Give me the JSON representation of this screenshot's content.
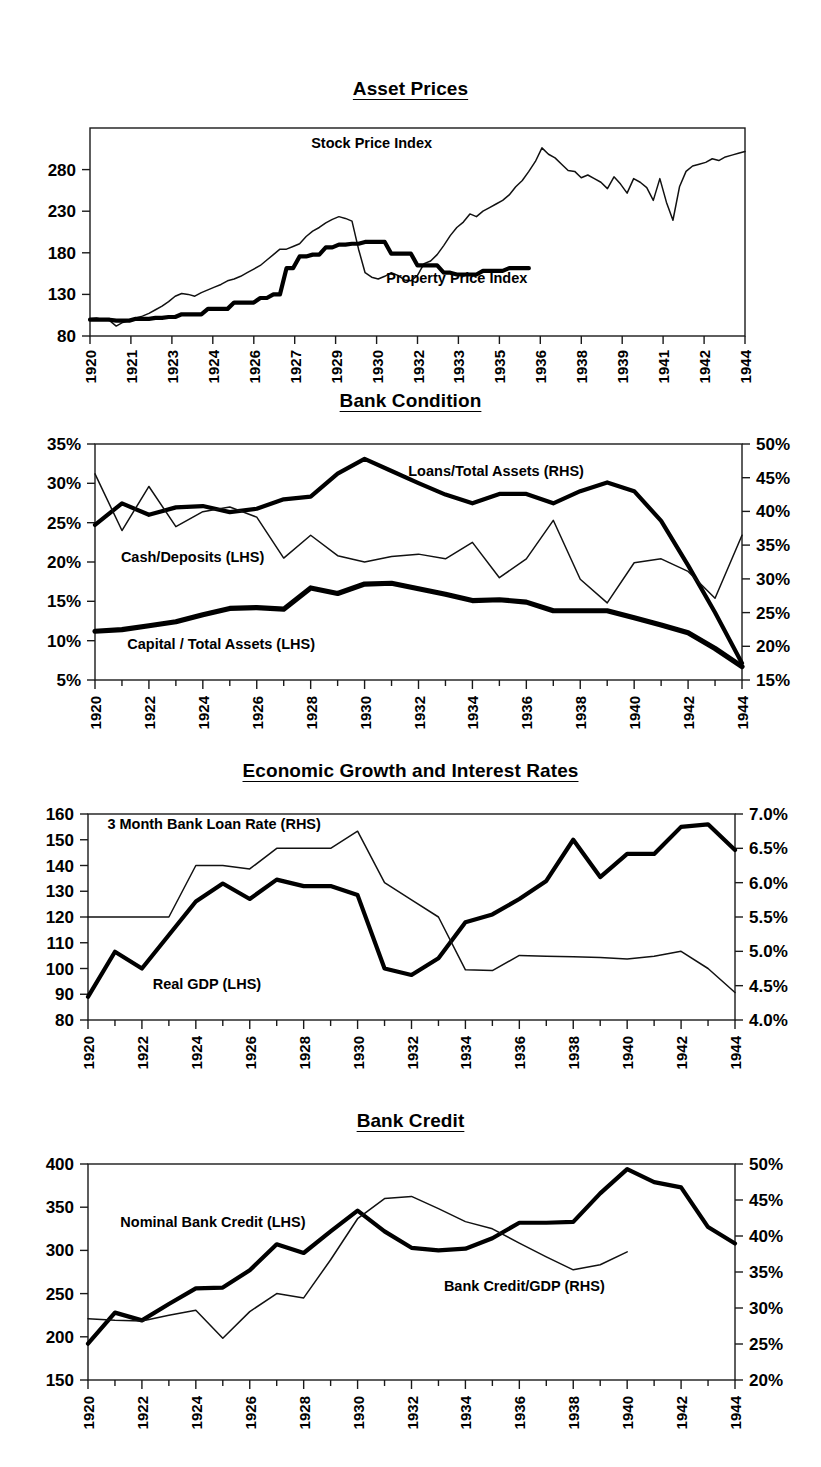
{
  "page": {
    "background": "#ffffff",
    "ink": "#000000"
  },
  "charts": [
    {
      "id": "asset-prices",
      "title": "Asset Prices",
      "chart_data": {
        "type": "line",
        "title": "Asset Prices",
        "xlabel": "",
        "ylabel": "",
        "grid": false,
        "legend": "inline-annotations",
        "y_left": {
          "ticks": [
            80,
            130,
            180,
            230,
            280
          ],
          "lim": [
            80,
            310
          ]
        },
        "x_tick_labels": [
          "1920",
          "1921",
          "1923",
          "1924",
          "1926",
          "1927",
          "1929",
          "1930",
          "1932",
          "1933",
          "1935",
          "1936",
          "1938",
          "1939",
          "1941",
          "1942",
          "1944"
        ],
        "x": [
          1920.0,
          1920.25,
          1920.5,
          1920.75,
          1921.0,
          1921.25,
          1921.5,
          1921.75,
          1922.0,
          1922.25,
          1922.5,
          1922.75,
          1923.0,
          1923.25,
          1923.5,
          1923.75,
          1924.0,
          1924.25,
          1924.5,
          1924.75,
          1925.0,
          1925.25,
          1925.5,
          1925.75,
          1926.0,
          1926.25,
          1926.5,
          1926.75,
          1927.0,
          1927.25,
          1927.5,
          1927.75,
          1928.0,
          1928.25,
          1928.5,
          1928.75,
          1929.0,
          1929.25,
          1929.5,
          1929.75,
          1930.0,
          1930.25,
          1930.5,
          1930.75,
          1931.0,
          1931.25,
          1931.5,
          1931.75,
          1932.0,
          1932.25,
          1932.5,
          1932.75,
          1933.0,
          1933.25,
          1933.5,
          1933.75,
          1934.0,
          1934.25,
          1934.5,
          1934.75,
          1935.0,
          1935.25,
          1935.5,
          1935.75,
          1936.0,
          1936.25,
          1936.5,
          1936.75,
          1937.0,
          1937.25,
          1937.5,
          1937.75,
          1938.0,
          1938.25,
          1938.5,
          1938.75,
          1939.0,
          1939.25,
          1939.5,
          1939.75,
          1940.0,
          1940.25,
          1940.5,
          1940.75,
          1941.0,
          1941.25,
          1941.5,
          1941.75,
          1942.0,
          1942.25,
          1942.5,
          1942.75,
          1943.0,
          1943.25,
          1943.5,
          1943.75,
          1944.0,
          1944.25,
          1944.5,
          1944.75,
          1945.0
        ],
        "series": [
          {
            "name": "Stock Price Index",
            "label": "Stock Price Index",
            "style": "thin",
            "values": [
              99,
              100,
              98,
              97,
              91,
              95,
              97,
              100,
              102,
              105,
              109,
              113,
              118,
              124,
              127,
              126,
              124,
              128,
              131,
              134,
              137,
              141,
              143,
              146,
              150,
              154,
              158,
              164,
              170,
              176,
              176,
              179,
              182,
              190,
              196,
              200,
              205,
              209,
              212,
              210,
              207,
              176,
              150,
              145,
              143,
              146,
              150,
              147,
              142,
              141,
              147,
              160,
              163,
              170,
              180,
              191,
              200,
              206,
              215,
              212,
              218,
              222,
              226,
              230,
              236,
              245,
              252,
              262,
              273,
              288,
              281,
              277,
              270,
              263,
              262,
              255,
              258,
              254,
              250,
              243,
              256,
              248,
              238,
              254,
              250,
              244,
              230,
              254,
              228,
              208,
              245,
              262,
              268,
              270,
              272,
              276,
              274,
              278,
              280,
              282,
              284
            ]
          },
          {
            "name": "Property Price Index",
            "label": "Property Price Index",
            "style": "thick",
            "values": [
              98,
              98,
              98,
              98,
              97,
              97,
              97,
              99,
              99,
              99,
              100,
              100,
              101,
              101,
              104,
              104,
              104,
              104,
              110,
              110,
              110,
              110,
              117,
              117,
              117,
              117,
              122,
              122,
              126,
              126,
              155,
              155,
              168,
              168,
              170,
              170,
              178,
              178,
              181,
              181,
              182,
              182,
              184,
              184,
              184,
              184,
              171,
              171,
              171,
              171,
              158,
              158,
              158,
              158,
              150,
              150,
              148,
              148,
              148,
              148,
              152,
              152,
              152,
              152,
              155,
              155,
              155,
              155,
              null,
              null,
              null,
              null,
              null,
              null,
              null,
              null,
              null,
              null,
              null,
              null,
              null,
              null,
              null,
              null,
              null,
              null,
              null,
              null,
              null,
              null,
              null,
              null,
              null,
              null,
              null,
              null,
              null,
              null,
              null,
              null,
              null
            ]
          }
        ],
        "annotations": [
          {
            "text": "Stock Price Index",
            "x_frac": 0.43,
            "y_value": 288
          },
          {
            "text": "Property Price Index",
            "x_frac": 0.56,
            "y_value": 139
          }
        ]
      }
    },
    {
      "id": "bank-condition",
      "title": "Bank Condition",
      "chart_data": {
        "type": "line",
        "title": "Bank Condition",
        "xlabel": "",
        "ylabel": "",
        "grid": false,
        "legend": "inline-annotations",
        "y_left": {
          "ticks": [
            "5%",
            "10%",
            "15%",
            "20%",
            "25%",
            "30%",
            "35%"
          ],
          "lim": [
            5,
            35
          ],
          "unit": "percent"
        },
        "y_right": {
          "ticks": [
            "15%",
            "20%",
            "25%",
            "30%",
            "35%",
            "40%",
            "45%",
            "50%"
          ],
          "lim": [
            15,
            50
          ],
          "unit": "percent"
        },
        "x_tick_labels": [
          "1920",
          "1922",
          "1924",
          "1926",
          "1928",
          "1930",
          "1932",
          "1934",
          "1936",
          "1938",
          "1940",
          "1942",
          "1944"
        ],
        "x": [
          1920,
          1921,
          1922,
          1923,
          1924,
          1925,
          1926,
          1927,
          1928,
          1929,
          1930,
          1931,
          1932,
          1933,
          1934,
          1935,
          1936,
          1937,
          1938,
          1939,
          1940,
          1941,
          1942,
          1943,
          1944
        ],
        "series": [
          {
            "name": "Loans/Total Assets (RHS)",
            "label": "Loans/Total Assets (RHS)",
            "style": "thick",
            "axis": "right",
            "values": [
              38.0,
              41.2,
              39.5,
              40.6,
              40.8,
              39.9,
              40.4,
              41.8,
              42.2,
              45.6,
              47.8,
              46.0,
              44.2,
              42.5,
              41.2,
              42.6,
              42.6,
              41.2,
              43.0,
              44.3,
              43.0,
              38.6,
              32.0,
              25.0,
              17.5
            ]
          },
          {
            "name": "Cash/Deposits (LHS)",
            "label": "Cash/Deposits (LHS)",
            "style": "thin",
            "axis": "left",
            "values": [
              31.2,
              24.0,
              29.6,
              24.5,
              26.4,
              27.0,
              25.7,
              20.5,
              23.4,
              20.8,
              20.0,
              20.7,
              21.0,
              20.4,
              22.5,
              18.0,
              20.4,
              25.3,
              17.8,
              14.8,
              19.9,
              20.4,
              18.8,
              15.4,
              23.4
            ]
          },
          {
            "name": "Capital / Total Assets (LHS)",
            "label": "Capital / Total Assets (LHS)",
            "style": "thickest",
            "axis": "left",
            "values": [
              11.2,
              11.4,
              11.9,
              12.4,
              13.3,
              14.1,
              14.2,
              14.0,
              16.7,
              16.0,
              17.2,
              17.3,
              16.6,
              15.9,
              15.1,
              15.2,
              14.9,
              13.8,
              13.8,
              13.8,
              12.9,
              12.0,
              11.0,
              9.0,
              6.7
            ]
          }
        ],
        "annotations": [
          {
            "text": "Loans/Total Assets (RHS)",
            "x_frac": 0.62,
            "y_value": 31.0
          },
          {
            "text": "Cash/Deposits (LHS)",
            "x_frac": 0.04,
            "y_value": 20.0
          },
          {
            "text": "Capital / Total Assets (LHS)",
            "x_frac": 0.05,
            "y_value": 9.0
          }
        ]
      }
    },
    {
      "id": "economic-growth-and-interest-rates",
      "title": "Economic Growth and Interest Rates",
      "chart_data": {
        "type": "line",
        "title": "Economic Growth and Interest Rates",
        "xlabel": "",
        "ylabel": "",
        "grid": false,
        "legend": "inline-annotations",
        "y_left": {
          "ticks": [
            80,
            90,
            100,
            110,
            120,
            130,
            140,
            150,
            160
          ],
          "lim": [
            80,
            160
          ]
        },
        "y_right": {
          "ticks": [
            "4.0%",
            "4.5%",
            "5.0%",
            "5.5%",
            "6.0%",
            "6.5%",
            "7.0%"
          ],
          "lim": [
            4.0,
            7.0
          ],
          "unit": "percent"
        },
        "x_tick_labels": [
          "1920",
          "1922",
          "1924",
          "1926",
          "1928",
          "1930",
          "1932",
          "1934",
          "1936",
          "1938",
          "1940",
          "1942",
          "1944"
        ],
        "x": [
          1920,
          1921,
          1922,
          1923,
          1924,
          1925,
          1926,
          1927,
          1928,
          1929,
          1930,
          1931,
          1932,
          1933,
          1934,
          1935,
          1936,
          1937,
          1938,
          1939,
          1940,
          1941,
          1942,
          1943,
          1944
        ],
        "series": [
          {
            "name": "Real GDP (LHS)",
            "label": "Real GDP (LHS)",
            "style": "thick",
            "axis": "left",
            "values": [
              89,
              106.5,
              100,
              113,
              126,
              133,
              127,
              134.5,
              132,
              132,
              128.5,
              100,
              97.5,
              104,
              118,
              121,
              127,
              134,
              150,
              135.5,
              144.5,
              144.5,
              155,
              156,
              146
            ]
          },
          {
            "name": "3 Month Bank Loan Rate (RHS)",
            "label": "3 Month Bank Loan Rate (RHS)",
            "style": "thin",
            "axis": "right",
            "values": [
              5.5,
              5.5,
              5.5,
              5.5,
              6.25,
              6.25,
              6.2,
              6.5,
              6.5,
              6.5,
              6.75,
              6.0,
              5.75,
              5.5,
              4.73,
              4.72,
              4.94,
              4.93,
              4.92,
              4.91,
              4.89,
              4.93,
              5.0,
              4.75,
              4.4
            ]
          }
        ],
        "annotations": [
          {
            "text": "3 Month Bank Loan Rate (RHS)",
            "x_frac": 0.03,
            "y_value": 154
          },
          {
            "text": "Real GDP (LHS)",
            "x_frac": 0.1,
            "y_value": 92
          }
        ]
      }
    },
    {
      "id": "bank-credit",
      "title": "Bank Credit",
      "chart_data": {
        "type": "line",
        "title": "Bank Credit",
        "xlabel": "",
        "ylabel": "",
        "grid": false,
        "legend": "inline-annotations",
        "y_left": {
          "ticks": [
            150,
            200,
            250,
            300,
            350,
            400
          ],
          "lim": [
            150,
            400
          ]
        },
        "y_right": {
          "ticks": [
            "20%",
            "25%",
            "30%",
            "35%",
            "40%",
            "45%",
            "50%"
          ],
          "lim": [
            20,
            50
          ],
          "unit": "percent"
        },
        "x_tick_labels": [
          "1920",
          "1922",
          "1924",
          "1926",
          "1928",
          "1930",
          "1932",
          "1934",
          "1936",
          "1938",
          "1940",
          "1942",
          "1944"
        ],
        "x": [
          1920,
          1921,
          1922,
          1923,
          1924,
          1925,
          1926,
          1927,
          1928,
          1929,
          1930,
          1931,
          1932,
          1933,
          1934,
          1935,
          1936,
          1937,
          1938,
          1939,
          1940,
          1941,
          1942,
          1943,
          1944
        ],
        "series": [
          {
            "name": "Nominal Bank Credit (LHS)",
            "label": "Nominal Bank Credit (LHS)",
            "style": "thick",
            "axis": "left",
            "values": [
              192,
              228,
              219,
              238,
              256,
              257,
              277,
              307,
              297,
              322,
              346,
              322,
              303,
              300,
              302,
              314,
              332,
              332,
              333,
              366,
              394,
              379,
              373,
              327,
              308
            ]
          },
          {
            "name": "Bank Credit/GDP (RHS)",
            "label": "Bank Credit/GDP (RHS)",
            "style": "thin",
            "axis": "right",
            "values": [
              28.5,
              28.3,
              28.2,
              29.0,
              29.7,
              25.8,
              29.5,
              32.0,
              31.4,
              36.7,
              42.4,
              45.2,
              45.5,
              43.8,
              42.0,
              41.0,
              39.0,
              37.1,
              35.3,
              36.0,
              37.8,
              null,
              null,
              null,
              null
            ]
          }
        ],
        "annotations": [
          {
            "text": "Nominal Bank Credit (LHS)",
            "x_frac": 0.05,
            "y_value": 327
          },
          {
            "text": "Bank Credit/GDP (RHS)",
            "x_frac": 0.55,
            "y_value": 253
          }
        ]
      }
    }
  ]
}
